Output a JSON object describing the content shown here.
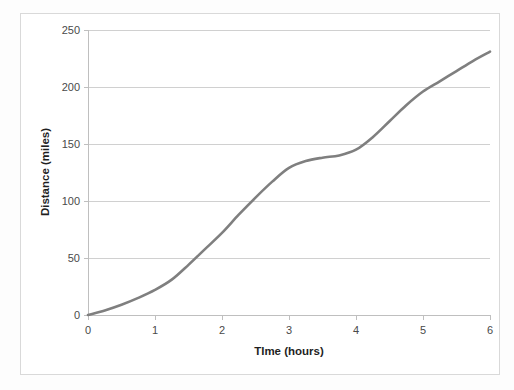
{
  "chart_data": {
    "type": "line",
    "title": "",
    "xlabel": "TIme (hours)",
    "ylabel": "Distance (miles)",
    "xlim": [
      0,
      6
    ],
    "ylim": [
      0,
      250
    ],
    "xticks": [
      "0",
      "1",
      "2",
      "3",
      "4",
      "5",
      "6"
    ],
    "yticks": [
      "0",
      "50",
      "100",
      "150",
      "200",
      "250"
    ],
    "grid": "horizontal",
    "legend": "none",
    "series": [
      {
        "name": "distance",
        "color": "#7f7f7f",
        "x": [
          0,
          0.25,
          0.5,
          0.75,
          1,
          1.25,
          1.5,
          1.75,
          2,
          2.25,
          2.5,
          2.75,
          3,
          3.25,
          3.5,
          3.75,
          4,
          4.25,
          4.5,
          4.75,
          5,
          5.25,
          5.5,
          5.75,
          6
        ],
        "values": [
          0,
          4,
          9,
          15,
          22,
          31,
          44,
          58,
          72,
          88,
          103,
          117,
          129,
          135,
          138,
          140,
          145,
          156,
          170,
          184,
          196,
          205,
          214,
          223,
          231
        ]
      }
    ]
  },
  "axis": {
    "y_title": "Distance (miles)",
    "x_title": "TIme (hours)"
  },
  "colors": {
    "series": "#7f7f7f",
    "grid": "#d0d0d0",
    "axis": "#bfbfbf",
    "frame": "#d9d9d9",
    "background": "#ffffff",
    "tick_text": "#4a4a4a",
    "title_text": "#1f1f1f"
  }
}
